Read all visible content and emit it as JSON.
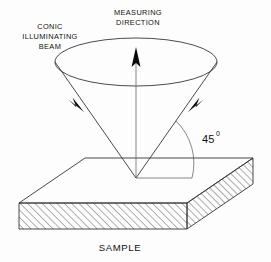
{
  "figure": {
    "title_labels": {
      "measuring_direction_line1": "MEASURING",
      "measuring_direction_line2": "DIRECTION",
      "conic_beam_line1": "CONIC",
      "conic_beam_line2": "ILLUMINATING",
      "conic_beam_line3": "BEAM",
      "sample": "SAMPLE"
    },
    "angle": {
      "value": "45",
      "degree_symbol": "0"
    },
    "colors": {
      "background": "#fdfdfd",
      "line": "#2b2b2b",
      "hairline": "#555555",
      "arrow_fill": "#0a0a0a",
      "slab_outline": "#333333",
      "text": "#111111"
    },
    "icons": {
      "measuring_arrow": "up-arrow-icon",
      "beam_arrow_left": "down-right-arrow-icon",
      "beam_arrow_right": "down-left-arrow-icon"
    }
  }
}
